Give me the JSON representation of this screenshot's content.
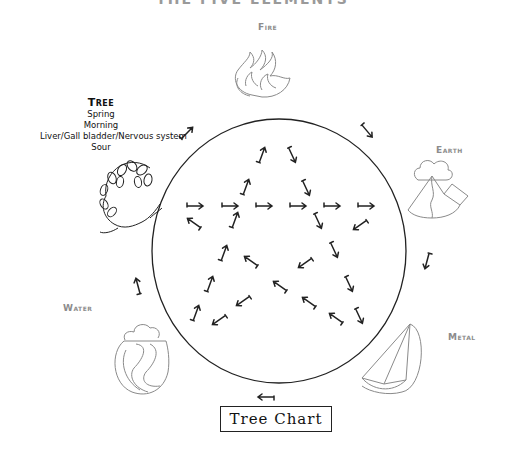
{
  "title": "THE FIVE ELEMENTS",
  "elements": {
    "fire": {
      "label": "Fire",
      "icon": "fire-icon"
    },
    "earth": {
      "label": "Earth",
      "icon": "mountain-icon"
    },
    "metal": {
      "label": "Metal",
      "icon": "metal-sail-icon"
    },
    "water": {
      "label": "Water",
      "icon": "water-wave-icon"
    },
    "tree": {
      "label": "Tree",
      "icon": "tree-branch-icon",
      "details": [
        "Spring",
        "Morning",
        "Liver/Gall bladder/Nervous system",
        "Sour"
      ]
    }
  },
  "chart_label": "Tree Chart",
  "colors": {
    "line": "#222222",
    "icon_stroke": "#8a8a8a",
    "label_gray": "#8c8c8c"
  },
  "circle": {
    "cx": 279,
    "cy": 251,
    "rx": 127,
    "ry": 132
  },
  "outer_arrows": [
    {
      "x": 187,
      "y": 133,
      "rot": -45
    },
    {
      "x": 367,
      "y": 131,
      "rot": 50
    },
    {
      "x": 427,
      "y": 261,
      "rot": 105
    },
    {
      "x": 266,
      "y": 397,
      "rot": 180
    },
    {
      "x": 138,
      "y": 286,
      "rot": -105
    }
  ],
  "inner_arrows": [
    {
      "x": 262,
      "y": 155,
      "rot": -70
    },
    {
      "x": 292,
      "y": 155,
      "rot": 65
    },
    {
      "x": 246,
      "y": 187,
      "rot": -70
    },
    {
      "x": 306,
      "y": 188,
      "rot": 65
    },
    {
      "x": 195,
      "y": 206,
      "rot": 0
    },
    {
      "x": 230,
      "y": 206,
      "rot": 0
    },
    {
      "x": 264,
      "y": 206,
      "rot": 0
    },
    {
      "x": 298,
      "y": 206,
      "rot": 0
    },
    {
      "x": 332,
      "y": 206,
      "rot": 0
    },
    {
      "x": 366,
      "y": 206,
      "rot": 0
    },
    {
      "x": 194,
      "y": 223,
      "rot": -145
    },
    {
      "x": 235,
      "y": 220,
      "rot": -70
    },
    {
      "x": 318,
      "y": 221,
      "rot": 65
    },
    {
      "x": 360,
      "y": 225,
      "rot": 145
    },
    {
      "x": 224,
      "y": 253,
      "rot": -70
    },
    {
      "x": 251,
      "y": 261,
      "rot": -145
    },
    {
      "x": 305,
      "y": 263,
      "rot": 145
    },
    {
      "x": 334,
      "y": 250,
      "rot": 65
    },
    {
      "x": 210,
      "y": 284,
      "rot": -70
    },
    {
      "x": 280,
      "y": 286,
      "rot": -145
    },
    {
      "x": 349,
      "y": 284,
      "rot": 65
    },
    {
      "x": 243,
      "y": 301,
      "rot": 145
    },
    {
      "x": 309,
      "y": 302,
      "rot": -145
    },
    {
      "x": 196,
      "y": 313,
      "rot": -70
    },
    {
      "x": 219,
      "y": 320,
      "rot": 145
    },
    {
      "x": 336,
      "y": 318,
      "rot": -145
    },
    {
      "x": 359,
      "y": 316,
      "rot": 65
    }
  ]
}
